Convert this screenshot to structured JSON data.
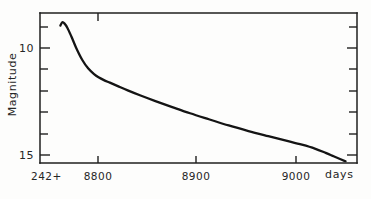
{
  "figure": {
    "background_color": "#fdfdfc",
    "ink_color": "#1a1a1a"
  },
  "chart_data": {
    "type": "line",
    "title": "",
    "subtitle": "",
    "xlabel": "days",
    "ylabel": "Magnitude",
    "x_offset_label": "242+",
    "xlim": [
      8750,
      9062
    ],
    "ylim_magnitude": [
      8.4,
      15.4
    ],
    "y_inverted": true,
    "grid": false,
    "legend": null,
    "x_major_ticks": [
      8800,
      8900,
      9000
    ],
    "x_major_tick_labels": [
      "8800",
      "8900",
      "9000"
    ],
    "y_major_ticks": [
      10,
      15
    ],
    "y_major_tick_labels": [
      "10",
      "15"
    ],
    "y_minor_tick_count": 7,
    "axis_frame": "box",
    "tick_direction": "in",
    "series": [
      {
        "name": "light curve",
        "x": [
          8762,
          8764,
          8766,
          8769,
          8773,
          8778,
          8784,
          8790,
          8796,
          8801,
          8806,
          8812,
          8820,
          8830,
          8843,
          8858,
          8875,
          8893,
          8912,
          8932,
          8952,
          8972,
          8990,
          9006,
          9019,
          9030,
          9038,
          9045,
          9050
        ],
        "y": [
          8.95,
          8.8,
          8.85,
          9.05,
          9.45,
          10.0,
          10.55,
          10.95,
          11.22,
          11.38,
          11.5,
          11.62,
          11.78,
          11.98,
          12.22,
          12.48,
          12.76,
          13.05,
          13.33,
          13.62,
          13.88,
          14.12,
          14.33,
          14.52,
          14.7,
          14.9,
          15.06,
          15.2,
          15.3
        ],
        "description": "Nova-like decline: sharp maximum near day 8764 at magnitude 8.8, rapid fade to a knee near day 8800 at magnitude 11.4, followed by a long near-linear decline to magnitude 15.3 by day 9050."
      }
    ]
  },
  "annotations": {
    "y_axis_label_text": "Magnitude",
    "x_axis_unit_text": "days",
    "x_axis_origin_text": "242+"
  }
}
